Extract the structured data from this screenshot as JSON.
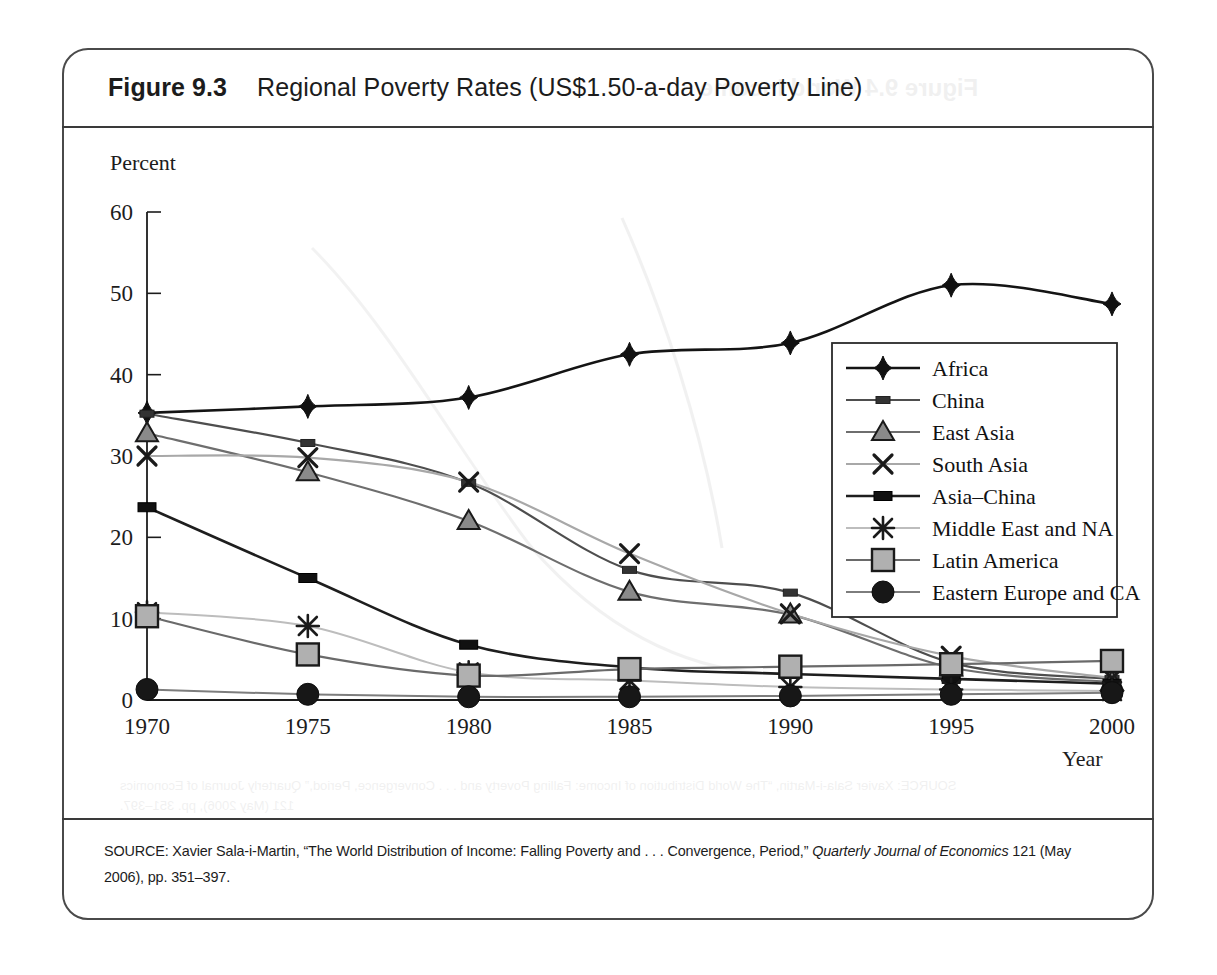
{
  "figure": {
    "number": "Figure 9.3",
    "title": "Regional Poverty Rates (US$1.50-a-day Poverty Line)",
    "source_prefix": "SOURCE: Xavier Sala-i-Martin, “The World Distribution of Income: Falling Poverty and . . . Convergence, Period,” ",
    "source_italic": "Quarterly Journal of Economics",
    "source_suffix": " 121 (May 2006), pp. 351–397."
  },
  "ghost_text": {
    "title": "Figure 9.4    World Income",
    "source_line1": "SOURCE: Xavier Sala-i-Martin, “The World Distribution of Income: Falling Poverty and . . . Convergence, Period,” Quarterly Journal of Economics",
    "source_line2": "121 (May 2006), pp. 351–397."
  },
  "chart_data": {
    "type": "line",
    "title": "Regional Poverty Rates (US$1.50-a-day Poverty Line)",
    "xlabel": "Year",
    "ylabel": "Percent",
    "x": [
      1970,
      1975,
      1980,
      1985,
      1990,
      1995,
      2000
    ],
    "xlim": [
      1970,
      2000
    ],
    "ylim": [
      0,
      60
    ],
    "yticks": [
      0,
      10,
      20,
      30,
      40,
      50,
      60
    ],
    "xticks": [
      1970,
      1975,
      1980,
      1985,
      1990,
      1995,
      2000
    ],
    "grid": false,
    "legend_position": "center-right",
    "series": [
      {
        "name": "Africa",
        "marker": "diamond",
        "color": "#141414",
        "line_width": 2.6,
        "values": [
          35.3,
          36.1,
          37.2,
          42.5,
          43.9,
          51.0,
          48.7
        ]
      },
      {
        "name": "China",
        "marker": "small-square",
        "color": "#4e4e4e",
        "line_width": 2.2,
        "values": [
          35.2,
          31.6,
          26.7,
          16.0,
          13.2,
          4.6,
          2.6
        ]
      },
      {
        "name": "East Asia",
        "marker": "triangle",
        "color": "#6e6e6e",
        "line_width": 2.2,
        "values": [
          32.8,
          28.0,
          22.0,
          13.3,
          10.5,
          4.0,
          2.2
        ]
      },
      {
        "name": "South Asia",
        "marker": "cross",
        "color": "#a8a8a8",
        "line_width": 2.2,
        "values": [
          30.0,
          29.8,
          26.8,
          18.0,
          10.6,
          5.4,
          2.7
        ]
      },
      {
        "name": "Asia–China",
        "marker": "wide-square",
        "color": "#1e1e1e",
        "line_width": 2.6,
        "values": [
          23.7,
          15.0,
          6.8,
          4.0,
          3.2,
          2.6,
          2.0
        ]
      },
      {
        "name": "Middle East and NA",
        "marker": "asterisk",
        "color": "#bdbdbd",
        "line_width": 2.0,
        "values": [
          10.8,
          9.1,
          3.4,
          2.4,
          1.6,
          1.3,
          1.1
        ]
      },
      {
        "name": "Latin America",
        "marker": "square",
        "color": "#6a6a6a",
        "line_width": 2.2,
        "values": [
          10.3,
          5.6,
          3.0,
          3.8,
          4.1,
          4.4,
          4.8
        ]
      },
      {
        "name": "Eastern Europe and CA",
        "marker": "circle",
        "color": "#7d7d7d",
        "line_width": 2.0,
        "values": [
          1.3,
          0.7,
          0.4,
          0.4,
          0.5,
          0.7,
          0.9
        ]
      }
    ]
  }
}
